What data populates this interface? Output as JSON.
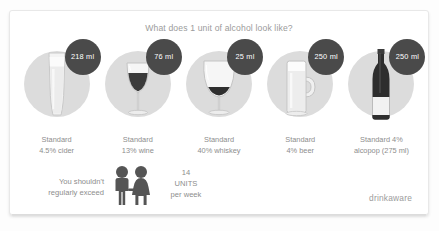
{
  "card": {
    "title": "What does 1 unit of alcohol look like?",
    "brand": "drinkaware"
  },
  "drinks": [
    {
      "icon": "pint-glass-icon",
      "badge": "218 ml",
      "caption_line1": "Standard",
      "caption_line2": "4.5% cider"
    },
    {
      "icon": "wine-glass-icon",
      "badge": "76 ml",
      "caption_line1": "Standard",
      "caption_line2": "13% wine"
    },
    {
      "icon": "whiskey-snifter-icon",
      "badge": "25 ml",
      "caption_line1": "Standard",
      "caption_line2": "40% whiskey"
    },
    {
      "icon": "beer-mug-icon",
      "badge": "250 ml",
      "caption_line1": "Standard",
      "caption_line2": "4% beer"
    },
    {
      "icon": "alcopop-bottle-icon",
      "badge": "250 ml",
      "caption_line1": "Standard 4%",
      "caption_line2": "alcopop (275 ml)"
    }
  ],
  "footer": {
    "advice_line1": "You shouldn't",
    "advice_line2": "regularly exceed",
    "people_icon": "couple-icon",
    "units_number": "14",
    "units_word": "UNITS",
    "units_period": "per week"
  },
  "colors": {
    "badge_fill": "#4a4a4a",
    "badge_text": "#ffffff",
    "disc_fill": "#dcdcdc",
    "text": "#8d8d8d",
    "title_text": "#9b9b9b",
    "card_bg": "#ffffff",
    "people_fill": "#555555"
  }
}
